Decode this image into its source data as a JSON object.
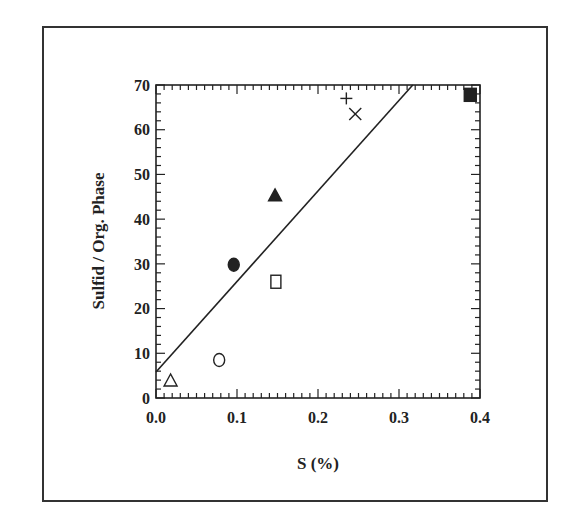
{
  "chart_data": {
    "type": "scatter",
    "title": "",
    "xlabel": "S (%)",
    "ylabel": "Sulfid / Org. Phase",
    "xlim": [
      0.0,
      0.4
    ],
    "ylim": [
      0,
      70
    ],
    "x_ticks": [
      "0.0",
      "0.1",
      "0.2",
      "0.3",
      "0.4"
    ],
    "y_ticks": [
      "0",
      "10",
      "20",
      "30",
      "40",
      "50",
      "60",
      "70"
    ],
    "grid": false,
    "legend": null,
    "series": [
      {
        "name": "open-triangle",
        "marker": "open-triangle",
        "x": 0.018,
        "y": 3.8
      },
      {
        "name": "open-circle",
        "marker": "open-circle",
        "x": 0.078,
        "y": 8.5
      },
      {
        "name": "filled-circle",
        "marker": "filled-circle",
        "x": 0.096,
        "y": 29.8
      },
      {
        "name": "open-square",
        "marker": "open-square",
        "x": 0.148,
        "y": 26.0
      },
      {
        "name": "filled-triangle",
        "marker": "filled-triangle",
        "x": 0.147,
        "y": 45.2
      },
      {
        "name": "plus",
        "marker": "plus",
        "x": 0.235,
        "y": 67.0
      },
      {
        "name": "cross",
        "marker": "cross",
        "x": 0.246,
        "y": 63.5
      },
      {
        "name": "filled-square",
        "marker": "filled-square",
        "x": 0.388,
        "y": 67.8
      }
    ],
    "trend_line": {
      "x": [
        0.0,
        0.317
      ],
      "y": [
        5.8,
        70.0
      ]
    }
  },
  "colors": {
    "ink": "#222222",
    "frame": "#333333",
    "background": "#ffffff"
  }
}
